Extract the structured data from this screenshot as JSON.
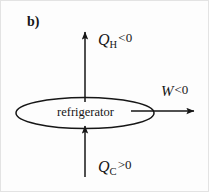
{
  "figure": {
    "panel_label": "b)",
    "body_label": "refrigerator",
    "background_color": "#fdfdfd",
    "stroke_color": "#161616"
  },
  "flows": {
    "hot": {
      "symbol": "Q",
      "subscript": "H",
      "relation": "<0",
      "direction": "up",
      "arrow_name": "arrow-qh-up"
    },
    "cold": {
      "symbol": "Q",
      "subscript": "C",
      "relation": ">0",
      "direction": "up",
      "arrow_name": "arrow-qc-up"
    },
    "work": {
      "symbol": "W",
      "subscript": "",
      "relation": "<0",
      "direction": "right",
      "arrow_name": "arrow-w-right"
    }
  }
}
